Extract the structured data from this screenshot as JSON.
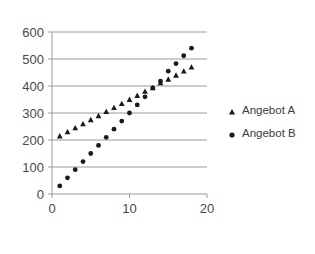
{
  "chart_data": {
    "type": "scatter",
    "title": "",
    "subtitle": "",
    "xlabel": "",
    "ylabel": "",
    "xlim": [
      0,
      20
    ],
    "ylim": [
      0,
      600
    ],
    "x_ticks": [
      "0",
      "10",
      "20"
    ],
    "x_tick_values": [
      0,
      10,
      20
    ],
    "y_ticks": [
      "0",
      "100",
      "200",
      "300",
      "400",
      "500",
      "600"
    ],
    "y_tick_values": [
      0,
      100,
      200,
      300,
      400,
      500,
      600
    ],
    "grid": "horizontal",
    "legend_position": "right",
    "series": [
      {
        "name": "Angebot A",
        "marker": "triangle",
        "color": "#1a1a1a",
        "x": [
          1,
          2,
          3,
          4,
          5,
          6,
          7,
          8,
          9,
          10,
          11,
          12,
          13,
          14,
          15,
          16,
          17,
          18
        ],
        "values": [
          215,
          230,
          245,
          260,
          275,
          290,
          305,
          320,
          335,
          350,
          365,
          380,
          393,
          412,
          425,
          440,
          455,
          470
        ]
      },
      {
        "name": "Angebot B",
        "marker": "circle",
        "color": "#1a1a1a",
        "x": [
          1,
          2,
          3,
          4,
          5,
          6,
          7,
          8,
          9,
          10,
          11,
          12,
          13,
          14,
          15,
          16,
          17,
          18
        ],
        "values": [
          30,
          60,
          90,
          120,
          150,
          180,
          210,
          240,
          270,
          300,
          330,
          360,
          393,
          418,
          455,
          483,
          512,
          540
        ]
      }
    ]
  },
  "legend": {
    "entries": [
      {
        "label": "Angebot A",
        "marker": "triangle"
      },
      {
        "label": "Angebot B",
        "marker": "circle"
      }
    ]
  },
  "colors": {
    "background": "#ffffff",
    "gridline": "#9a9a9a",
    "axis": "#9a9a9a",
    "marker": "#1a1a1a",
    "tick_text": "#4a4a4a",
    "legend_text": "#3b3b3b"
  }
}
